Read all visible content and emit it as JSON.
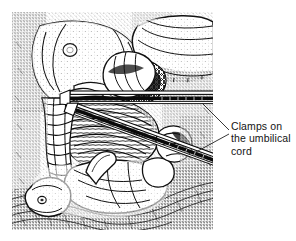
{
  "figure": {
    "kind": "medical-line-engraving",
    "background_color": "#ffffff",
    "ink_color": "#1a1a1a",
    "frame": {
      "left": 12,
      "top": 12,
      "width": 201,
      "height": 218
    }
  },
  "callout": {
    "label": "Clamps on\nthe umbilical\ncord",
    "label_lines": [
      "Clamps on",
      "the umbilical",
      "cord"
    ],
    "text_color": "#141414",
    "line_color": "#222222",
    "leaders": [
      {
        "name": "upper-clamp-leader",
        "from_x": 202,
        "from_y": 103,
        "to_x": 229,
        "to_y": 130
      },
      {
        "name": "lower-clamp-leader",
        "from_x": 196,
        "from_y": 152,
        "to_x": 229,
        "to_y": 134
      }
    ]
  },
  "instruments": [
    {
      "name": "upper-clamp",
      "description": "horizontal surgical clamp crossing the cord",
      "orientation": "horizontal"
    },
    {
      "name": "lower-clamp",
      "description": "diagonal surgical clamp crossing the cord",
      "orientation": "diagonal"
    }
  ],
  "anatomy": [
    {
      "name": "maternal-perineum",
      "description": "rounded maternal tissue, upper left"
    },
    {
      "name": "maternal-thigh",
      "description": "upper right limb form"
    },
    {
      "name": "umbilical-cord",
      "description": "twisted cord descending from clamps"
    },
    {
      "name": "newborn-infant",
      "description": "infant body and head, lower left"
    }
  ]
}
